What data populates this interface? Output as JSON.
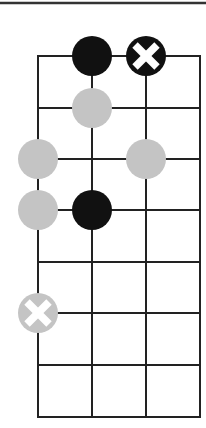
{
  "diagram": {
    "type": "fretboard-chord-diagram",
    "top_rule": {
      "y": 3,
      "x1": 0,
      "x2": 206
    },
    "grid": {
      "columns_x": [
        38,
        92,
        146,
        200
      ],
      "rows_y": [
        56,
        108,
        159,
        210,
        262,
        313,
        365,
        417
      ],
      "line_color": "#222222",
      "line_width": 2
    },
    "markers": [
      {
        "col": 1,
        "row": 0,
        "kind": "filled",
        "fill": "#111111",
        "label": "black-dot"
      },
      {
        "col": 2,
        "row": 0,
        "kind": "x",
        "fill": "#111111",
        "x_color": "#ffffff",
        "label": "black-x-dot"
      },
      {
        "col": 1,
        "row": 1,
        "kind": "filled",
        "fill": "#c4c4c4",
        "label": "gray-dot"
      },
      {
        "col": 0,
        "row": 2,
        "kind": "filled",
        "fill": "#c4c4c4",
        "label": "gray-dot"
      },
      {
        "col": 2,
        "row": 2,
        "kind": "filled",
        "fill": "#c4c4c4",
        "label": "gray-dot"
      },
      {
        "col": 0,
        "row": 3,
        "kind": "filled",
        "fill": "#c4c4c4",
        "label": "gray-dot"
      },
      {
        "col": 1,
        "row": 3,
        "kind": "filled",
        "fill": "#111111",
        "label": "black-dot"
      },
      {
        "col": 0,
        "row": 5,
        "kind": "x",
        "fill": "#c4c4c4",
        "x_color": "#ffffff",
        "label": "gray-x-dot"
      }
    ],
    "marker_radius": 20
  }
}
